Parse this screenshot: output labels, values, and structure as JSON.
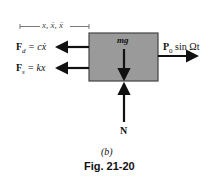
{
  "diagram": {
    "displacement_label": "x, ẋ, ẍ",
    "block_label": "mg",
    "forces": {
      "damping": {
        "symbol": "F",
        "subscript": "d",
        "rhs": "= cẋ"
      },
      "spring": {
        "symbol": "F",
        "subscript": "s",
        "rhs": "= kx"
      },
      "applied": {
        "symbol": "P",
        "subscript": "0",
        "rhs": "sin Ωt"
      },
      "normal": "N"
    },
    "block_color": "#9a9a9a",
    "arrow_color": "#111111"
  },
  "caption": {
    "part": "(b)",
    "figure": "Fig. 21-20"
  }
}
